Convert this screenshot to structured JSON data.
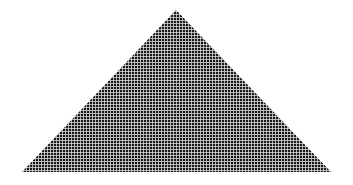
{
  "figure": {
    "shape": "triangle",
    "apex": [
      176,
      10
    ],
    "base_left": [
      22,
      172
    ],
    "base_right": [
      331,
      172
    ],
    "cell_pitch_px": 3,
    "cell_size_px": 2.2,
    "colors": {
      "background": "#ffffff",
      "cell": "#1a1a1a",
      "gap": "#d8d8d8"
    }
  }
}
